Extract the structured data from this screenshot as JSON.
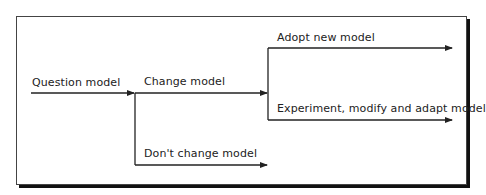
{
  "diagram": {
    "nodes": [
      {
        "id": "question",
        "label": "Question model"
      },
      {
        "id": "change",
        "label": "Change model"
      },
      {
        "id": "adopt",
        "label": "Adopt new model"
      },
      {
        "id": "experiment",
        "label": "Experiment, modify and adapt model"
      },
      {
        "id": "dont_change",
        "label": "Don't change model"
      }
    ],
    "edges": [
      {
        "from": "question",
        "to": "change"
      },
      {
        "from": "change",
        "to": "adopt"
      },
      {
        "from": "change",
        "to": "experiment"
      },
      {
        "from": "question",
        "to": "dont_change"
      }
    ],
    "colors": {
      "line": "#222222",
      "frame": "#444444",
      "shadow": "#111111",
      "background": "#ffffff"
    }
  }
}
